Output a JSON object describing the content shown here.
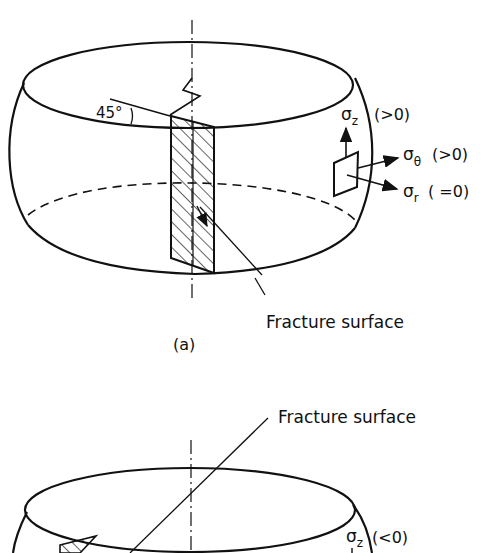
{
  "figure": {
    "panel_a": {
      "caption": "(a)",
      "angle_label": "45°",
      "sigma_z": "σ",
      "sigma_z_sub": "z",
      "sigma_z_cond": "(>0)",
      "sigma_theta": "σ",
      "sigma_theta_sub": "θ",
      "sigma_theta_cond": "(>0)",
      "sigma_r": "σ",
      "sigma_r_sub": "r",
      "sigma_r_cond": "( =0)",
      "fracture_label": "Fracture surface"
    },
    "panel_b": {
      "fracture_label": "Fracture surface",
      "sigma_z": "σ",
      "sigma_z_sub": "z",
      "sigma_z_cond": "(<0)"
    },
    "colors": {
      "ink": "#111111",
      "background": "#ffffff"
    }
  }
}
